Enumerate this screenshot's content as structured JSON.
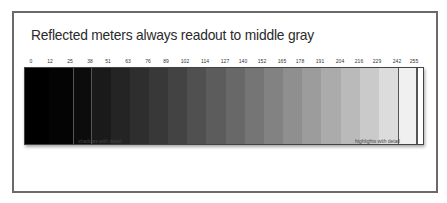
{
  "figure": {
    "title": "Reflected meters always readout to middle gray",
    "captions": {
      "shadows": "shadows with detail",
      "highlights": "highlights with detail"
    },
    "patches": [
      {
        "value": "0",
        "gray": "#000000",
        "left": 0,
        "width": 24,
        "label_x": 31,
        "boxed": false
      },
      {
        "value": "12",
        "gray": "#040404",
        "left": 24,
        "width": 24,
        "label_x": 50,
        "boxed": false
      },
      {
        "value": "25",
        "gray": "#0c0c0c",
        "left": 48,
        "width": 19,
        "label_x": 70,
        "boxed": true
      },
      {
        "value": "38",
        "gray": "#1a1a1a",
        "left": 67,
        "width": 19,
        "label_x": 90,
        "boxed": false
      },
      {
        "value": "51",
        "gray": "#242424",
        "left": 86,
        "width": 19,
        "label_x": 108,
        "boxed": false
      },
      {
        "value": "63",
        "gray": "#2e2e2e",
        "left": 105,
        "width": 19,
        "label_x": 128,
        "boxed": false
      },
      {
        "value": "76",
        "gray": "#383838",
        "left": 124,
        "width": 19,
        "label_x": 148,
        "boxed": false
      },
      {
        "value": "89",
        "gray": "#434343",
        "left": 143,
        "width": 19,
        "label_x": 166,
        "boxed": false
      },
      {
        "value": "102",
        "gray": "#505050",
        "left": 162,
        "width": 19,
        "label_x": 185,
        "boxed": false
      },
      {
        "value": "114",
        "gray": "#5c5c5c",
        "left": 181,
        "width": 20,
        "label_x": 205,
        "boxed": false
      },
      {
        "value": "127",
        "gray": "#686868",
        "left": 201,
        "width": 19,
        "label_x": 225,
        "boxed": false
      },
      {
        "value": "140",
        "gray": "#757575",
        "left": 220,
        "width": 19,
        "label_x": 243,
        "boxed": false
      },
      {
        "value": "152",
        "gray": "#828282",
        "left": 239,
        "width": 19,
        "label_x": 262,
        "boxed": false
      },
      {
        "value": "165",
        "gray": "#8f8f8f",
        "left": 258,
        "width": 19,
        "label_x": 282,
        "boxed": false
      },
      {
        "value": "178",
        "gray": "#9c9c9c",
        "left": 277,
        "width": 19,
        "label_x": 300,
        "boxed": false
      },
      {
        "value": "191",
        "gray": "#ababab",
        "left": 296,
        "width": 20,
        "label_x": 320,
        "boxed": false
      },
      {
        "value": "204",
        "gray": "#bababa",
        "left": 316,
        "width": 19,
        "label_x": 340,
        "boxed": false
      },
      {
        "value": "216",
        "gray": "#cacaca",
        "left": 335,
        "width": 19,
        "label_x": 359,
        "boxed": false
      },
      {
        "value": "229",
        "gray": "#dcdcdc",
        "left": 354,
        "width": 19,
        "label_x": 377,
        "boxed": false
      },
      {
        "value": "242",
        "gray": "#f0f0f0",
        "left": 373,
        "width": 19,
        "label_x": 397,
        "boxed": true
      },
      {
        "value": "255",
        "gray": "#ffffff",
        "left": 392,
        "width": 8,
        "label_x": 414,
        "boxed": true
      }
    ],
    "colors": {
      "frame_border": "#6a6a6a",
      "text": "#2a2a2a"
    }
  }
}
